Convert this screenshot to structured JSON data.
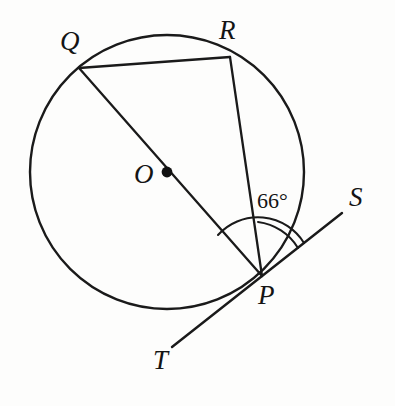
{
  "figure": {
    "background_color": "#fdfdfc",
    "ink_color": "#1a1a1a"
  },
  "circle": {
    "name": "circle-O",
    "center_label": "O",
    "center_x": 167,
    "center_y": 172,
    "radius": 137
  },
  "points": [
    {
      "id": "Q",
      "label": "Q",
      "x": 79,
      "y": 68,
      "on_circle": true
    },
    {
      "id": "R",
      "label": "R",
      "x": 230,
      "y": 57,
      "on_circle": true
    },
    {
      "id": "O",
      "label": "O",
      "x": 167,
      "y": 172,
      "on_circle": false
    },
    {
      "id": "P",
      "label": "P",
      "x": 262,
      "y": 276,
      "on_circle": true
    },
    {
      "id": "S",
      "label": "S",
      "x": 342,
      "y": 213,
      "on_circle": false
    },
    {
      "id": "T",
      "label": "T",
      "x": 172,
      "y": 347,
      "on_circle": false
    }
  ],
  "segments": [
    {
      "id": "QP",
      "from": "Q",
      "to": "P",
      "kind": "diameter"
    },
    {
      "id": "QR",
      "from": "Q",
      "to": "R",
      "kind": "chord"
    },
    {
      "id": "RP",
      "from": "R",
      "to": "P",
      "kind": "chord"
    },
    {
      "id": "TS",
      "from": "T",
      "to": "S",
      "kind": "tangent",
      "tangent_at": "P"
    }
  ],
  "angles": [
    {
      "id": "angle-OPS",
      "label": "66°",
      "value": 66,
      "vertex": "P",
      "ray_a": "O",
      "ray_b": "S",
      "arc": "major"
    },
    {
      "id": "angle-RPS",
      "label": "",
      "vertex": "P",
      "ray_a": "R",
      "ray_b": "S",
      "arc": "minor"
    }
  ],
  "labels": {
    "Q": "Q",
    "R": "R",
    "O": "O",
    "P": "P",
    "S": "S",
    "T": "T",
    "angle": "66°"
  }
}
